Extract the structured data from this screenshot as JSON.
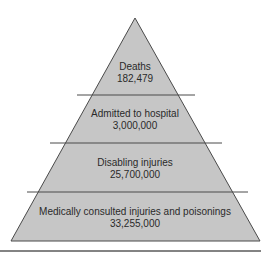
{
  "diagram": {
    "type": "pyramid",
    "fill_color": "#c6c6c6",
    "line_color": "#4a4a4a",
    "tiers": [
      {
        "label": "Deaths",
        "value": "182,479"
      },
      {
        "label": "Admitted to hospital",
        "value": "3,000,000"
      },
      {
        "label": "Disabling injuries",
        "value": "25,700,000"
      },
      {
        "label": "Medically consulted injuries and poisonings",
        "value": "33,255,000"
      }
    ]
  }
}
